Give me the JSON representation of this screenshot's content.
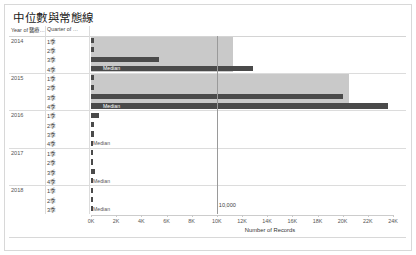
{
  "title": "中位數與常態線",
  "shelf": {
    "year_header": "Year of 醫療…",
    "quarter_header": "Quarter of …"
  },
  "axis": {
    "title": "Number of Records",
    "ticks": [
      "0K",
      "2K",
      "4K",
      "6K",
      "8K",
      "10K",
      "12K",
      "14K",
      "16K",
      "18K",
      "20K",
      "22K",
      "24K"
    ],
    "tick_values": [
      0,
      2000,
      4000,
      6000,
      8000,
      10000,
      12000,
      14000,
      16000,
      18000,
      20000,
      22000,
      24000
    ],
    "min": 0,
    "max": 24000
  },
  "reference_line": {
    "label": "10,000",
    "value": 10000,
    "color": "#9a9a9a"
  },
  "colors": {
    "bar": "#4a4a4a",
    "band": "#c9c9c9",
    "grid": "#dcdcdc",
    "border": "#d8d8d8"
  },
  "median_label": "Median",
  "chart_data": {
    "type": "bar",
    "title": "中位數與常態線",
    "xlabel": "Number of Records",
    "ylabel": "",
    "xlim": [
      0,
      24000
    ],
    "grid": true,
    "legend": "none",
    "orientation": "horizontal",
    "groups": [
      {
        "year": "2014",
        "rows": [
          {
            "quarter": "1季",
            "value": 210,
            "band_end": 11300,
            "median": false
          },
          {
            "quarter": "2季",
            "value": 230,
            "band_end": 11300,
            "median": false
          },
          {
            "quarter": "3季",
            "value": 5400,
            "band_end": 11300,
            "median": false
          },
          {
            "quarter": "4季",
            "value": 12900,
            "band_end": 11300,
            "median": true
          }
        ]
      },
      {
        "year": "2015",
        "rows": [
          {
            "quarter": "1季",
            "value": 230,
            "band_end": 20500,
            "median": false
          },
          {
            "quarter": "2季",
            "value": 240,
            "band_end": 20500,
            "median": false
          },
          {
            "quarter": "3季",
            "value": 20000,
            "band_end": 20500,
            "median": false
          },
          {
            "quarter": "4季",
            "value": 23600,
            "band_end": 20500,
            "median": true
          }
        ]
      },
      {
        "year": "2016",
        "rows": [
          {
            "quarter": "1季",
            "value": 640,
            "band_end": 0,
            "median": false
          },
          {
            "quarter": "2季",
            "value": 240,
            "band_end": 0,
            "median": false
          },
          {
            "quarter": "3季",
            "value": 200,
            "band_end": 0,
            "median": false
          },
          {
            "quarter": "4季",
            "value": 170,
            "band_end": 0,
            "median": true
          }
        ]
      },
      {
        "year": "2017",
        "rows": [
          {
            "quarter": "1季",
            "value": 160,
            "band_end": 0,
            "median": false
          },
          {
            "quarter": "2季",
            "value": 160,
            "band_end": 0,
            "median": false
          },
          {
            "quarter": "3季",
            "value": 300,
            "band_end": 0,
            "median": false
          },
          {
            "quarter": "4季",
            "value": 170,
            "band_end": 0,
            "median": true
          }
        ]
      },
      {
        "year": "2018",
        "rows": [
          {
            "quarter": "1季",
            "value": 150,
            "band_end": 0,
            "median": false
          },
          {
            "quarter": "2季",
            "value": 150,
            "band_end": 0,
            "median": false
          },
          {
            "quarter": "3季",
            "value": 160,
            "band_end": 0,
            "median": true
          }
        ]
      }
    ]
  }
}
